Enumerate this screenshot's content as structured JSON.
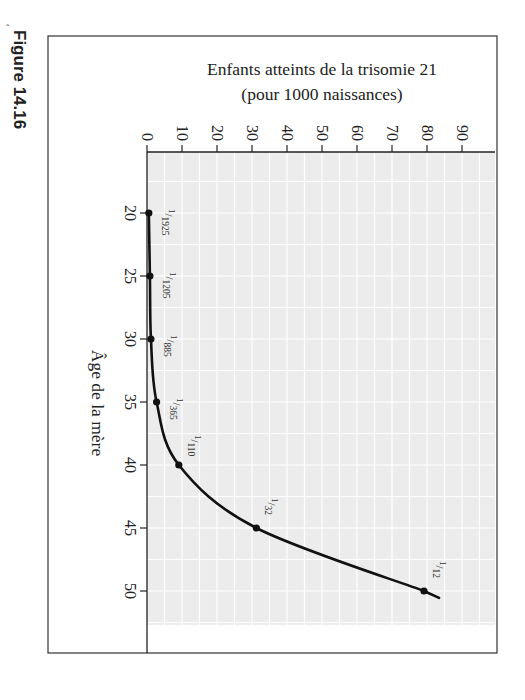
{
  "figure_label": "Figure 14.16",
  "chart_data": {
    "type": "line",
    "orientation": "rotated 90° clockwise (age axis runs top-to-bottom, value axis runs left-to-right)",
    "title": "Enfants atteints de la trisomie 21",
    "title_line1": "Enfants atteints de la trisomie 21",
    "title_line2": "(pour 1000 naissances)",
    "ylabel": "Enfants atteints de la trisomie 21 (pour 1000 naissances)",
    "xlabel": "Âge de la mère",
    "x": [
      20,
      25,
      30,
      35,
      40,
      45,
      50
    ],
    "values": [
      0.52,
      0.83,
      1.13,
      2.74,
      9.09,
      31.25,
      83.3
    ],
    "point_labels": [
      {
        "num": "1",
        "den": "1925"
      },
      {
        "num": "1",
        "den": "1205"
      },
      {
        "num": "1",
        "den": "885"
      },
      {
        "num": "1",
        "den": "365"
      },
      {
        "num": "1",
        "den": "110"
      },
      {
        "num": "1",
        "den": "32"
      },
      {
        "num": "1",
        "den": "12"
      }
    ],
    "xticks": [
      "20",
      "25",
      "30",
      "35",
      "40",
      "45",
      "50"
    ],
    "yticks": [
      "0",
      "10",
      "20",
      "30",
      "40",
      "50",
      "60",
      "70",
      "80",
      "90"
    ],
    "ylim": [
      0,
      100
    ],
    "xlim": [
      15,
      53
    ],
    "grid": true,
    "legend": null,
    "colors": {
      "plot_background": "#ececec",
      "grid": "#ffffff",
      "line": "#111111",
      "frame": "#333333"
    }
  }
}
